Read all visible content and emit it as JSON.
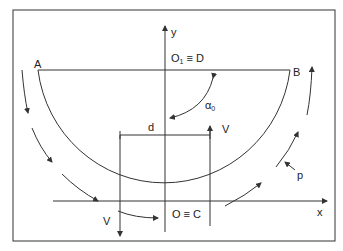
{
  "diagram": {
    "labels": {
      "A": "A",
      "B": "B",
      "y_axis": "y",
      "x_axis": "x",
      "top_center_O": "O",
      "top_center_sub": "1",
      "top_center_eq": " ≡ D",
      "bottom_center": "O ≡ C",
      "d": "d",
      "V_right": "V",
      "V_left": "V",
      "alpha": "α",
      "alpha_sub": "0",
      "p": "p"
    },
    "colors": {
      "line": "#333333",
      "background": "#ffffff"
    }
  }
}
